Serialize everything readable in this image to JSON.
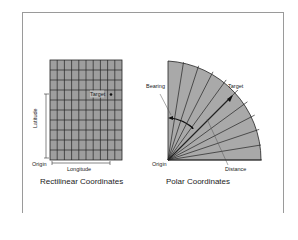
{
  "rectilinear": {
    "caption": "Rectilinear Coordinates",
    "labels": {
      "target": "Target",
      "latitude": "Latitude",
      "longitude": "Longitude",
      "origin": "Origin"
    },
    "grid": {
      "cols": 10,
      "rows": 10,
      "fill": "#9e9e9e",
      "line": "#222222"
    }
  },
  "polar": {
    "caption": "Polar Coordinates",
    "labels": {
      "bearing": "Bearing",
      "target": "Target",
      "distance": "Distance",
      "origin": "Origin"
    },
    "fill": "#a9a9a9",
    "rays": 10
  }
}
